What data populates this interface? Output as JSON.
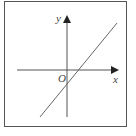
{
  "diagram": {
    "type": "coordinate-plane",
    "x_axis_label": "x",
    "y_axis_label": "y",
    "origin_label": "O",
    "line": {
      "description": "straight line with positive slope and negative y-intercept",
      "slope_sign": "positive",
      "y_intercept_sign": "negative",
      "x_intercept_sign": "positive",
      "quadrants_passed": [
        "I",
        "III",
        "IV"
      ]
    },
    "colors": {
      "axis": "#555555",
      "line": "#666666",
      "frame": "#555555"
    }
  }
}
